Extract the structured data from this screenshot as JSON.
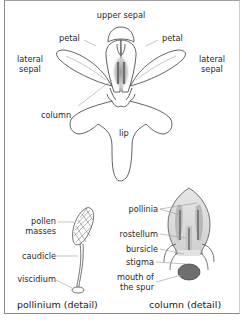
{
  "diagram": {
    "flower_labels": {
      "upper_sepal": "upper sepal",
      "petal_left": "petal",
      "petal_right": "petal",
      "lateral_sepal_left": [
        "lateral",
        "sepal"
      ],
      "lateral_sepal_right": [
        "lateral",
        "sepal"
      ],
      "column": "column",
      "lip": "lip"
    },
    "pollinium_detail": {
      "caption": "pollinium (detail)",
      "labels": {
        "pollen_masses": [
          "pollen",
          "masses"
        ],
        "caudicle": "caudicle",
        "viscidium": "viscidium"
      }
    },
    "column_detail": {
      "caption": "column (detail)",
      "labels": {
        "pollinia": "pollinia",
        "rostellum": "rostellum",
        "bursicle": "bursicle",
        "stigma": "stigma",
        "mouth_of_spur": [
          "mouth of",
          "the spur"
        ]
      }
    },
    "colors": {
      "outline": "#3a3a3a",
      "leader_line": "#9a9a9a",
      "pollinia_fill": "#b8b8b8",
      "pollinia_dark": "#7a7a7a",
      "spur_mouth": "#6f6f6f"
    }
  }
}
